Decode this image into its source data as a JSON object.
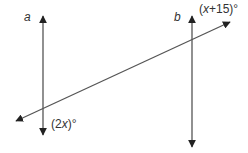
{
  "diagram": {
    "type": "parallel-lines-transversal",
    "lines": [
      {
        "id": "a",
        "label": "a",
        "orientation": "vertical",
        "arrows": "both"
      },
      {
        "id": "b",
        "label": "b",
        "orientation": "vertical",
        "arrows": "both"
      },
      {
        "id": "t",
        "label": "",
        "orientation": "diagonal transversal",
        "arrows": "both"
      }
    ],
    "angles": [
      {
        "at": "intersection of b and transversal",
        "label_var": "x",
        "label_rest": "+15)°",
        "label_open": "(",
        "full": "(x +15)°"
      },
      {
        "at": "intersection of a and transversal",
        "label_open": "(2",
        "label_var": "x",
        "label_rest": ")°",
        "full": "(2x)°"
      }
    ],
    "colors": {
      "line": "#555555",
      "arrow": "#222222",
      "text": "#333333",
      "background": "#ffffff"
    }
  }
}
